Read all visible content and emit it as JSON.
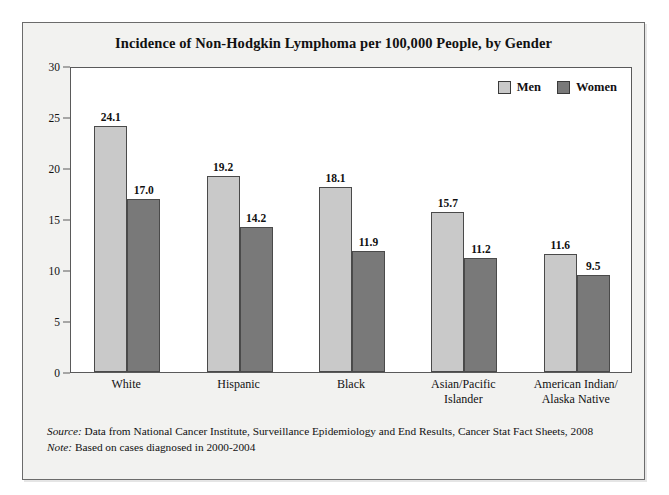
{
  "figure": {
    "title": "Incidence of Non-Hodgkin Lymphoma per 100,000 People, by Gender",
    "source_key": "Source:",
    "source_text": "Data from National Cancer Institute, Surveillance Epidemiology and End Results, Cancer Stat Fact Sheets, 2008",
    "note_key": "Note:",
    "note_text": "Based on cases diagnosed in 2000-2004"
  },
  "legend": {
    "position": "top-right-inside-plot",
    "items": [
      {
        "label": "Men",
        "color": "#c9c9c9"
      },
      {
        "label": "Women",
        "color": "#797979"
      }
    ]
  },
  "axis": {
    "y_ticks": [
      "30",
      "25",
      "20",
      "15",
      "10",
      "5",
      "0"
    ],
    "y_tick_values": [
      30,
      25,
      20,
      15,
      10,
      5,
      0
    ]
  },
  "chart_data": {
    "type": "bar",
    "title": "Incidence of Non-Hodgkin Lymphoma per 100,000 People, by Gender",
    "xlabel": "",
    "ylabel": "",
    "ylim": [
      0,
      30
    ],
    "ytick_step": 5,
    "grid": false,
    "legend_position": "upper right",
    "categories": [
      "White",
      "Hispanic",
      "Black",
      "Asian/Pacific Islander",
      "American Indian/ Alaska Native"
    ],
    "category_lines": [
      [
        "White"
      ],
      [
        "Hispanic"
      ],
      [
        "Black"
      ],
      [
        "Asian/Pacific",
        "Islander"
      ],
      [
        "American Indian/",
        "Alaska Native"
      ]
    ],
    "series": [
      {
        "name": "Men",
        "color": "#c9c9c9",
        "values": [
          24.1,
          19.2,
          18.1,
          15.7,
          11.6
        ],
        "labels": [
          "24.1",
          "19.2",
          "18.1",
          "15.7",
          "11.6"
        ]
      },
      {
        "name": "Women",
        "color": "#797979",
        "values": [
          17.0,
          14.2,
          11.9,
          11.2,
          9.5
        ],
        "labels": [
          "17.0",
          "14.2",
          "11.9",
          "11.2",
          "9.5"
        ]
      }
    ],
    "source": "Data from National Cancer Institute, Surveillance Epidemiology and End Results, Cancer Stat Fact Sheets, 2008",
    "note": "Based on cases diagnosed in 2000-2004"
  }
}
